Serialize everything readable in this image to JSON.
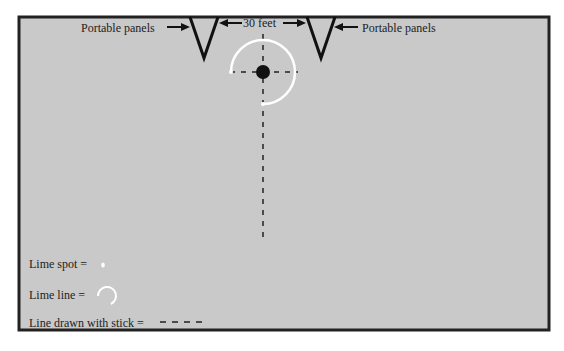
{
  "diagram": {
    "labels": {
      "left_panel": "Portable panels",
      "right_panel": "Portable panels",
      "distance": "30 feet"
    },
    "legend": {
      "lime_spot": "Lime spot =",
      "lime_line": "Lime line =",
      "stick_line": "Line drawn with stick ="
    }
  }
}
